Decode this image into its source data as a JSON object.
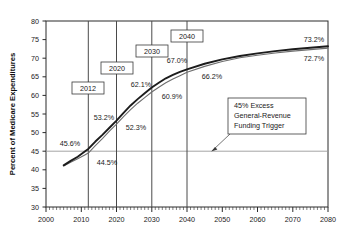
{
  "chart_data": {
    "type": "line",
    "title": "",
    "xlabel": "",
    "ylabel": "Percent of Medicare Expenditures",
    "xlim": [
      2000,
      2080
    ],
    "ylim": [
      30,
      80
    ],
    "xticks": [
      2000,
      2010,
      2020,
      2030,
      2040,
      2050,
      2060,
      2070,
      2080
    ],
    "yticks": [
      30,
      35,
      40,
      45,
      50,
      55,
      60,
      65,
      70,
      75,
      80
    ],
    "grid": false,
    "minor_ticks": "every year on x-axis",
    "legend": "none",
    "reference_line": {
      "y": 45,
      "label": "45% Excess General-Revenue Funding Trigger"
    },
    "marker_years": [
      2012,
      2020,
      2030,
      2040
    ],
    "series": [
      {
        "name": "upper",
        "x": [
          2005,
          2007,
          2009,
          2011,
          2012,
          2014,
          2016,
          2018,
          2020,
          2022,
          2024,
          2026,
          2028,
          2030,
          2032,
          2034,
          2036,
          2038,
          2040,
          2045,
          2050,
          2055,
          2060,
          2065,
          2070,
          2075,
          2080
        ],
        "values": [
          41.2,
          42.4,
          43.5,
          44.9,
          45.6,
          47.6,
          49.4,
          51.3,
          53.2,
          55.3,
          57.3,
          59.0,
          60.6,
          62.1,
          63.4,
          64.6,
          65.5,
          66.3,
          67.0,
          68.5,
          69.7,
          70.6,
          71.3,
          71.9,
          72.4,
          72.8,
          73.2
        ]
      },
      {
        "name": "lower",
        "x": [
          2005,
          2007,
          2009,
          2011,
          2012,
          2014,
          2016,
          2018,
          2020,
          2022,
          2024,
          2026,
          2028,
          2030,
          2032,
          2034,
          2036,
          2038,
          2040,
          2045,
          2050,
          2055,
          2060,
          2065,
          2070,
          2075,
          2080
        ],
        "values": [
          41.0,
          42.0,
          43.0,
          44.0,
          44.5,
          46.5,
          48.4,
          50.4,
          52.3,
          54.3,
          56.2,
          57.9,
          59.4,
          60.9,
          62.2,
          63.4,
          64.4,
          65.3,
          66.2,
          67.8,
          69.1,
          70.1,
          70.8,
          71.4,
          71.9,
          72.3,
          72.7
        ]
      }
    ],
    "annotations": [
      {
        "name": "2012-high",
        "text": "45.6%"
      },
      {
        "name": "2012-low",
        "text": "44.5%"
      },
      {
        "name": "2020-high",
        "text": "53.2%"
      },
      {
        "name": "2020-low",
        "text": "52.3%"
      },
      {
        "name": "2030-high",
        "text": "62.1%"
      },
      {
        "name": "2030-low",
        "text": "60.9%"
      },
      {
        "name": "2040-high",
        "text": "67.0%"
      },
      {
        "name": "2040-low",
        "text": "66.2%"
      },
      {
        "name": "2080-high",
        "text": "73.2%"
      },
      {
        "name": "2080-low",
        "text": "72.7%"
      }
    ]
  },
  "axis": {
    "y_title": "Percent of Medicare Expenditures",
    "y_ticks": [
      "80",
      "75",
      "70",
      "65",
      "60",
      "55",
      "50",
      "45",
      "40",
      "35",
      "30"
    ],
    "x_ticks": [
      "2000",
      "2010",
      "2020",
      "2030",
      "2040",
      "2050",
      "2060",
      "2070",
      "2080"
    ]
  },
  "markers": {
    "m2012": "2012",
    "m2020": "2020",
    "m2030": "2030",
    "m2040": "2040"
  },
  "values": {
    "v2012_high": "45.6%",
    "v2012_low": "44.5%",
    "v2020_high": "53.2%",
    "v2020_low": "52.3%",
    "v2030_high": "62.1%",
    "v2030_low": "60.9%",
    "v2040_high": "67.0%",
    "v2040_low": "66.2%",
    "v2080_high": "73.2%",
    "v2080_low": "72.7%"
  },
  "callout": {
    "line1": "45% Excess",
    "line2": "General-Revenue",
    "line3": "Funding Trigger"
  },
  "colors": {
    "series_high": "#1c1c1c",
    "series_low": "#6e6e6e",
    "axis": "#2b2b2b",
    "reference_line": "#9a9a9a",
    "marker_line": "#4a4a4a",
    "background": "#ffffff"
  }
}
